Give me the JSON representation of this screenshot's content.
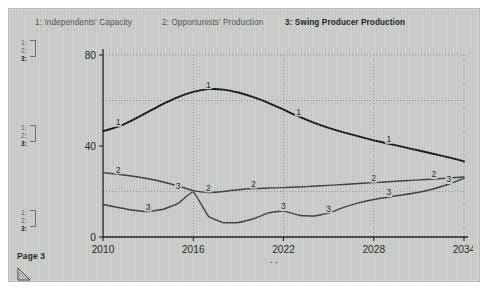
{
  "document": {
    "page_label": "Page 3",
    "corner_handle_icon": "resize-corner-icon"
  },
  "legend": {
    "items": [
      {
        "id": "1",
        "label": "1: Independents' Capacity",
        "bold": false
      },
      {
        "id": "2",
        "label": "2: Opportunists' Production",
        "bold": false
      },
      {
        "id": "3",
        "label": "3: Swing Producer Production",
        "bold": true
      }
    ]
  },
  "margin_brackets": {
    "groups": [
      {
        "n1": "1:",
        "n2": "2:",
        "n3": "3:"
      },
      {
        "n1": "1:",
        "n2": "2:",
        "n3": "3:"
      },
      {
        "n1": "1:",
        "n2": "2:",
        "n3": "3:"
      }
    ]
  },
  "chart_data": {
    "type": "line",
    "title": "",
    "xlabel": "Years",
    "ylabel": "",
    "xlim": [
      2010,
      2034
    ],
    "ylim": [
      0,
      80
    ],
    "xticks": [
      2010,
      2016,
      2022,
      2028,
      2034
    ],
    "xticklabels": [
      "2010",
      "2016",
      "2022",
      "2028",
      "2034"
    ],
    "yticks": [
      0,
      40,
      80
    ],
    "yticklabels": [
      "0",
      "40",
      "80"
    ],
    "gridlines": {
      "vertical_dotted": [
        2016,
        2022,
        2028,
        2034
      ],
      "horizontal_dotted": [
        20,
        60,
        80
      ]
    },
    "legend_position": "top",
    "x": [
      2010,
      2011,
      2012,
      2013,
      2014,
      2015,
      2016,
      2017,
      2018,
      2019,
      2020,
      2021,
      2022,
      2023,
      2024,
      2025,
      2026,
      2027,
      2028,
      2029,
      2030,
      2031,
      2032,
      2033,
      2034
    ],
    "series": [
      {
        "name": "1: Independents' Capacity",
        "id": "1",
        "values": [
          46.5,
          48.5,
          51.5,
          55.0,
          58.5,
          61.5,
          63.8,
          65.0,
          64.8,
          63.5,
          61.5,
          59.0,
          56.0,
          53.0,
          50.3,
          48.0,
          46.0,
          44.2,
          42.5,
          41.0,
          39.5,
          38.0,
          36.5,
          35.0,
          33.2
        ],
        "inline_labels": [
          {
            "x": 2011,
            "y": 48.5
          },
          {
            "x": 2017,
            "y": 65.0
          },
          {
            "x": 2023,
            "y": 53.0
          },
          {
            "x": 2029,
            "y": 41.0
          }
        ]
      },
      {
        "name": "2: Opportunists' Production",
        "id": "2",
        "values": [
          28.3,
          27.6,
          26.7,
          25.6,
          24.2,
          22.4,
          20.4,
          19.6,
          20.0,
          20.8,
          21.3,
          21.5,
          21.7,
          22.0,
          22.3,
          22.7,
          23.1,
          23.5,
          23.9,
          24.3,
          24.7,
          25.1,
          25.5,
          25.9,
          26.4
        ],
        "inline_labels": [
          {
            "x": 2011,
            "y": 27.6
          },
          {
            "x": 2017,
            "y": 19.6
          },
          {
            "x": 2020,
            "y": 21.3
          },
          {
            "x": 2028,
            "y": 23.9
          },
          {
            "x": 2032,
            "y": 25.5
          }
        ]
      },
      {
        "name": "3: Swing Producer Production",
        "id": "3",
        "values": [
          14.3,
          13.0,
          11.8,
          11.2,
          12.2,
          14.8,
          19.8,
          9.2,
          6.3,
          6.4,
          8.0,
          10.6,
          11.4,
          9.6,
          9.2,
          10.5,
          13.0,
          15.0,
          16.5,
          17.6,
          18.6,
          19.7,
          21.2,
          23.3,
          25.8
        ],
        "inline_labels": [
          {
            "x": 2013,
            "y": 11.2
          },
          {
            "x": 2015,
            "y": 20.5
          },
          {
            "x": 2022,
            "y": 11.4
          },
          {
            "x": 2025,
            "y": 10.5
          },
          {
            "x": 2029,
            "y": 17.6
          },
          {
            "x": 2033,
            "y": 23.3
          }
        ]
      }
    ]
  },
  "colors": {
    "paper": "#c9ccc9",
    "ink": "#1b1d1b",
    "curve1": "#15181a",
    "curve2": "#3a3e40",
    "curve3": "#3a3e40",
    "grid": "#7d807d"
  }
}
